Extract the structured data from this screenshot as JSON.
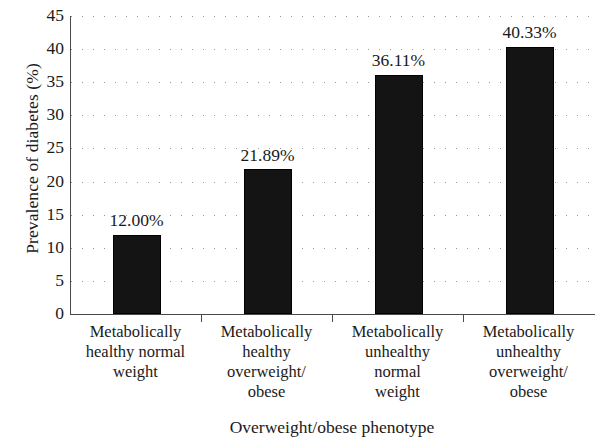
{
  "chart_data": {
    "type": "bar",
    "title": "",
    "xlabel": "Overweight/obese phenotype",
    "ylabel": "Prevalence of diabetes (%)",
    "categories": [
      "Metabolically healthy normal weight",
      "Metabolically healthy overweight/ obese",
      "Metabolically unhealthy normal weight",
      "Metabolically unhealthy overweight/ obese"
    ],
    "category_lines": [
      [
        "Metabolically",
        "healthy normal",
        "weight"
      ],
      [
        "Metabolically",
        "healthy",
        "overweight/",
        "obese"
      ],
      [
        "Metabolically",
        "unhealthy",
        "normal",
        "weight"
      ],
      [
        "Metabolically",
        "unhealthy",
        "overweight/",
        "obese"
      ]
    ],
    "values": [
      12.0,
      21.89,
      36.11,
      40.33
    ],
    "value_labels": [
      "12.00%",
      "21.89%",
      "36.11%",
      "40.33%"
    ],
    "ylim": [
      0,
      45
    ],
    "ytick_step": 5,
    "yticks": [
      45,
      40,
      35,
      30,
      25,
      20,
      15,
      10,
      5,
      0
    ],
    "ytick_labels": [
      "45",
      "40",
      "35",
      "30",
      "25",
      "20",
      "15",
      "10",
      "5",
      "0"
    ],
    "grid": "horizontal-dotted",
    "legend": "none",
    "bar_color": "#141414",
    "grid_color": "#9a9a9a",
    "axis_color": "#4a4a4a",
    "text_color": "#1a1a1a"
  }
}
